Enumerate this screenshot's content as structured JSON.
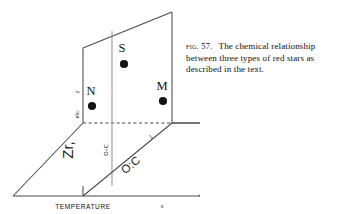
{
  "figure": {
    "caption_label": "FIG. 57.",
    "caption_body": "The chemical relationship between three types of red stars as described in the text.",
    "colors": {
      "line": "#4a4a4a",
      "point": "#141414",
      "text": "#111111",
      "background": "#ffffff"
    },
    "axis_labels": {
      "horizontal_bottom": "TEMPERATURE",
      "horizontal_right": "x",
      "vertical_z": "z",
      "vertical_etc": "etc.",
      "vertical_zr": "Zr,",
      "mid_plane_ratio": "O÷C",
      "diagonal_ratio": "O:C",
      "diagonal_tick": "1"
    },
    "data_points": [
      {
        "label": "S",
        "x": 124,
        "y": 64,
        "label_x": 122,
        "label_y": 52,
        "r": 4.1
      },
      {
        "label": "N",
        "x": 92,
        "y": 106,
        "label_x": 91,
        "label_y": 94,
        "r": 4.1
      },
      {
        "label": "M",
        "x": 163,
        "y": 101,
        "label_x": 162,
        "label_y": 89,
        "r": 4.1
      }
    ],
    "geometry": {
      "horizontal_plane": "13,196 83,123 172,123 199,196",
      "vertical_plane": "83,123 83,48 172,12 172,123",
      "mid_vertical_line": "112,186 112,31",
      "diagonal_line": "83,196 172,123",
      "dashed_back_edge": "83,123 172,123",
      "bottom_edge": "13,196 199,196"
    }
  }
}
